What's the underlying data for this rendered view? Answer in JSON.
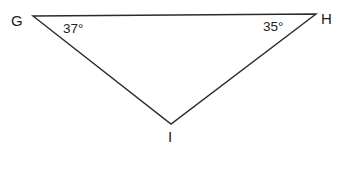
{
  "diagram": {
    "type": "triangle",
    "stroke_color": "#2a2a2a",
    "text_color": "#222222",
    "vertices": [
      {
        "name": "G",
        "label": "G",
        "x": 33,
        "y": 16
      },
      {
        "name": "H",
        "label": "H",
        "x": 316,
        "y": 14
      },
      {
        "name": "I",
        "label": "I",
        "x": 171,
        "y": 124
      }
    ],
    "angles": [
      {
        "vertex": "G",
        "label": "37°"
      },
      {
        "vertex": "H",
        "label": "35°"
      }
    ]
  }
}
